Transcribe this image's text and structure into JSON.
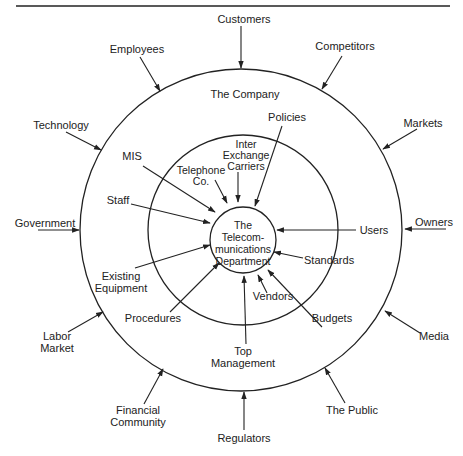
{
  "diagram": {
    "center_label": [
      "The",
      "Telecom-",
      "munications",
      "Department"
    ],
    "middle_ring_label": "The Company",
    "outer_environment": {
      "customers": "Customers",
      "competitors": "Competitors",
      "markets": "Markets",
      "owners": "Owners",
      "media": "Media",
      "the_public": "The Public",
      "regulators": "Regulators",
      "financial_community": [
        "Financial",
        "Community"
      ],
      "labor_market": [
        "Labor",
        "Market"
      ],
      "government": "Government",
      "technology": "Technology",
      "employees": "Employees"
    },
    "company_influences": {
      "policies": "Policies",
      "inter_exchange_carriers": [
        "Inter",
        "Exchange",
        "Carriers"
      ],
      "telephone_co": [
        "Telephone",
        "Co."
      ],
      "mis": "MIS",
      "staff": "Staff",
      "existing_equipment": [
        "Existing",
        "Equipment"
      ],
      "procedures": "Procedures",
      "top_management": [
        "Top",
        "Management"
      ],
      "vendors": "Vendors",
      "budgets": "Budgets",
      "standards": "Standards",
      "users": "Users"
    },
    "colors": {
      "ink": "#222222",
      "background": "#ffffff"
    }
  }
}
